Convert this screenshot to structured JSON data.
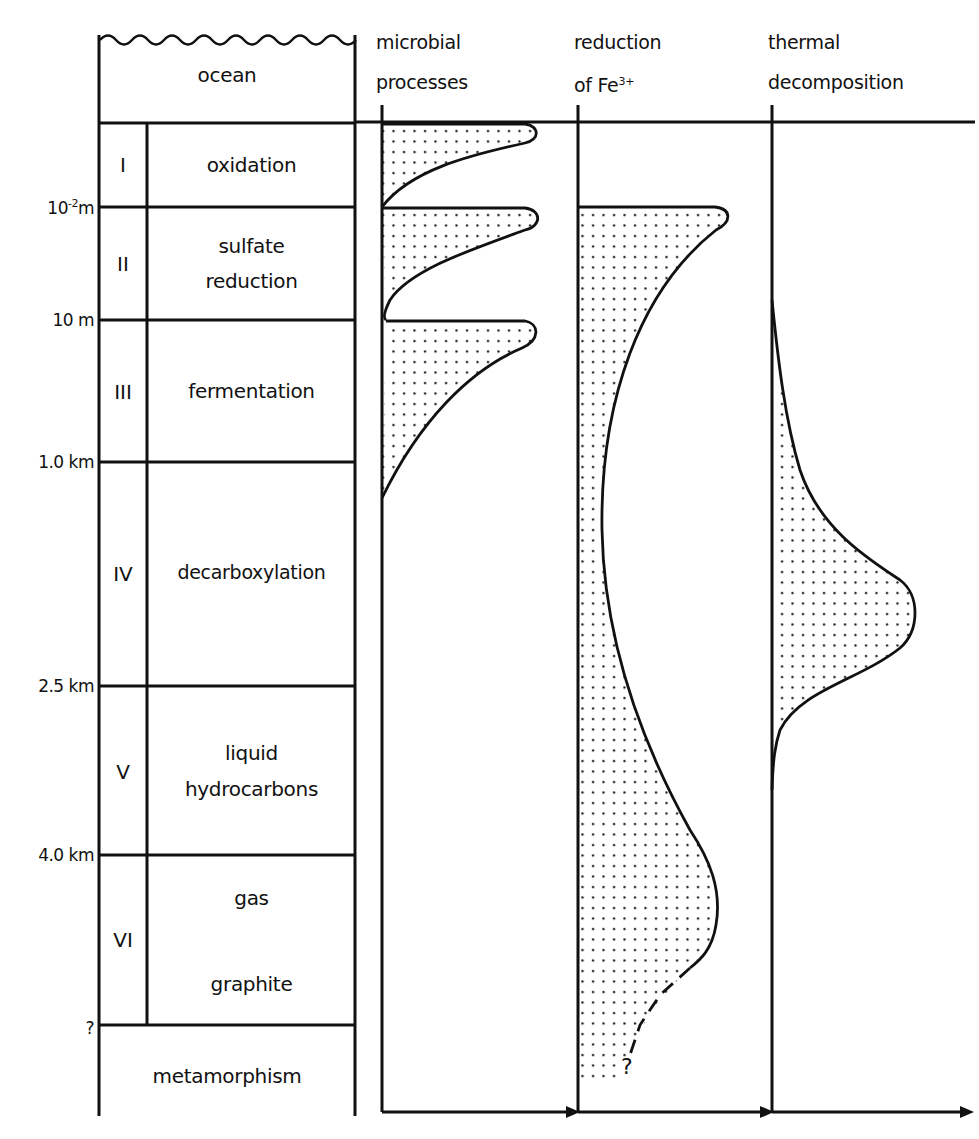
{
  "diagram": {
    "type": "depth-profile",
    "top_label": "ocean",
    "zones": [
      {
        "roman": "I",
        "name": "oxidation",
        "name_lines": [
          "oxidation"
        ]
      },
      {
        "roman": "II",
        "name": "sulfate reduction",
        "name_lines": [
          "sulfate",
          "reduction"
        ]
      },
      {
        "roman": "III",
        "name": "fermentation",
        "name_lines": [
          "fermentation"
        ]
      },
      {
        "roman": "IV",
        "name": "decarboxylation",
        "name_lines": [
          "decarboxylation"
        ]
      },
      {
        "roman": "V",
        "name": "liquid hydrocarbons",
        "name_lines": [
          "liquid",
          "hydrocarbons"
        ]
      },
      {
        "roman": "VI",
        "name": "gas graphite",
        "name_lines": [
          "gas",
          "graphite"
        ]
      }
    ],
    "bottom_label": "metamorphism",
    "depth_marks": [
      {
        "label_base": "10",
        "label_sup": "-2",
        "label_unit": "m",
        "text": "10^-2 m"
      },
      {
        "text": "10 m"
      },
      {
        "text": "1.0 km"
      },
      {
        "text": "2.5 km"
      },
      {
        "text": "4.0 km"
      },
      {
        "text": "?"
      }
    ],
    "columns": [
      {
        "id": "microbial",
        "lines": [
          "microbial",
          "processes"
        ]
      },
      {
        "id": "fe",
        "line1": "reduction",
        "line2_base": "of  Fe",
        "line2_sup": "3+"
      },
      {
        "id": "thermal",
        "lines": [
          "thermal",
          "decomposition"
        ]
      }
    ],
    "uncertain_marker": "?",
    "colors": {
      "ink": "#111111",
      "paper": "#ffffff"
    }
  }
}
